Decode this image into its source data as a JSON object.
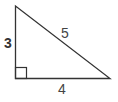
{
  "diagram": {
    "type": "right-triangle",
    "sides": {
      "vertical": "3",
      "hypotenuse": "5",
      "horizontal": "4"
    },
    "right_angle_marker": true,
    "colors": {
      "stroke": "#333333",
      "label": "#333333",
      "background": "#ffffff"
    }
  }
}
